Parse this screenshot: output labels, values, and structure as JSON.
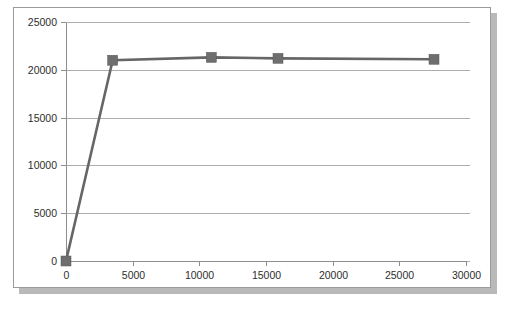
{
  "chart_data": {
    "type": "line",
    "title": "",
    "subtitle": "",
    "xlabel": "",
    "ylabel": "",
    "xlim": [
      0,
      30000
    ],
    "ylim": [
      0,
      25000
    ],
    "x_ticks": [
      0,
      5000,
      10000,
      15000,
      20000,
      25000,
      30000
    ],
    "x_tick_labels": [
      "0",
      "5000",
      "10000",
      "15000",
      "20000",
      "25000",
      "30000"
    ],
    "y_ticks": [
      0,
      5000,
      10000,
      15000,
      20000,
      25000
    ],
    "y_tick_labels": [
      "0",
      "5000",
      "10000",
      "15000",
      "20000",
      "25000"
    ],
    "grid": {
      "horizontal": true,
      "vertical": false
    },
    "legend": {
      "visible": false,
      "position": "none",
      "entries": []
    },
    "annotations": [],
    "series": [
      {
        "name": "Series 1",
        "color": "#666666",
        "marker": "square",
        "marker_color": "#6e6e6e",
        "points": [
          {
            "x": 0,
            "y": 0
          },
          {
            "x": 3500,
            "y": 21000
          },
          {
            "x": 10900,
            "y": 21300
          },
          {
            "x": 15900,
            "y": 21200
          },
          {
            "x": 27600,
            "y": 21100
          }
        ]
      }
    ]
  },
  "figure": {
    "background_color": "#ffffff",
    "frame_border_color": "#9a9a9a",
    "shadow_color": "#b9b9b9",
    "gridline_color": "#adadad",
    "axis_color": "#8d8d8d",
    "tick_label_color": "#2d2d2d"
  }
}
